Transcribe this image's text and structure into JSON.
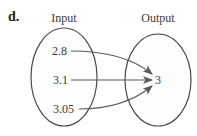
{
  "part_label": "d.",
  "diagram": {
    "type": "mapping",
    "input_title": "Input",
    "output_title": "Output",
    "inputs": [
      "2.8",
      "3.1",
      "3.05"
    ],
    "outputs": [
      "3"
    ],
    "mappings": [
      {
        "from": "2.8",
        "to": "3"
      },
      {
        "from": "3.1",
        "to": "3"
      },
      {
        "from": "3.05",
        "to": "3"
      }
    ]
  },
  "colors": {
    "stroke": "#4a4a4a",
    "text": "#3a3a3a"
  }
}
